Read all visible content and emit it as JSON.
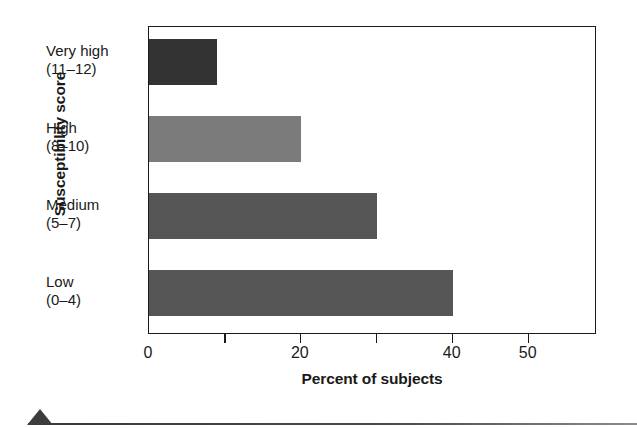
{
  "chart_data": {
    "type": "bar",
    "orientation": "horizontal",
    "title": "",
    "xlabel": "Percent of subjects",
    "ylabel": "Susceptibility score",
    "categories": [
      "Very high",
      "High",
      "Medium",
      "Low"
    ],
    "category_ranges": [
      "(11–12)",
      "(8–10)",
      "(5–7)",
      "(0–4)"
    ],
    "values": [
      9,
      20,
      30,
      40
    ],
    "bar_colors": [
      "#333333",
      "#7b7b7b",
      "#555555",
      "#565656"
    ],
    "xlim": [
      0,
      59
    ],
    "ylim": null,
    "x_ticks": [
      0,
      10,
      20,
      30,
      40,
      50
    ],
    "x_tick_labels": [
      "0",
      "",
      "20",
      "",
      "40",
      "50"
    ],
    "grid": false,
    "legend": null
  },
  "axis": {
    "y_title": "Susceptibility score",
    "x_title": "Percent of subjects"
  },
  "bottom_decoration": {
    "marker": "triangle-marker",
    "rule": "horizontal-rule"
  }
}
